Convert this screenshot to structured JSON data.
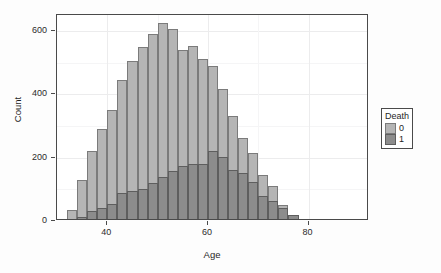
{
  "chart_data": {
    "type": "bar",
    "subtype": "histogram-overlapping",
    "title": "",
    "subtitle": "",
    "xlabel": "Age",
    "ylabel": "Count",
    "xlim": [
      30,
      92
    ],
    "ylim": [
      0,
      650
    ],
    "xticks": [
      40,
      60,
      80
    ],
    "xtick_labels": [
      "40",
      "60",
      "80"
    ],
    "yticks": [
      0,
      200,
      400,
      600
    ],
    "ytick_labels": [
      "0",
      "200",
      "400",
      "600"
    ],
    "grid": true,
    "bin_width": 2,
    "bin_starts": [
      32,
      34,
      36,
      38,
      40,
      42,
      44,
      46,
      48,
      50,
      52,
      54,
      56,
      58,
      60,
      62,
      64,
      66,
      68,
      70,
      72,
      74,
      76,
      78,
      80,
      82
    ],
    "legend": {
      "title": "Death",
      "position": "right",
      "entries": [
        {
          "label": "0",
          "color": "#b5b5b5"
        },
        {
          "label": "1",
          "color": "#8c8c8c"
        }
      ]
    },
    "series": [
      {
        "name": "0",
        "label": "Death = 0",
        "color": "#b5b5b5",
        "values": [
          35,
          130,
          220,
          290,
          350,
          445,
          505,
          550,
          590,
          625,
          605,
          540,
          552,
          510,
          490,
          415,
          330,
          262,
          215,
          145,
          112,
          52,
          20,
          6,
          2,
          0
        ]
      },
      {
        "name": "1",
        "label": "Death = 1",
        "color": "#8c8c8c",
        "values": [
          0,
          12,
          30,
          42,
          55,
          88,
          95,
          100,
          120,
          138,
          158,
          175,
          180,
          180,
          222,
          202,
          160,
          150,
          122,
          78,
          62,
          40,
          18,
          5,
          1,
          0
        ]
      }
    ],
    "colors": {
      "series_0": "#b5b5b5",
      "series_1": "#8c8c8c",
      "panel_background": "#ffffff",
      "panel_border": "#4a4a4a",
      "gridline": "#ececed",
      "axis_text": "#1f1f1f"
    }
  },
  "axes": {
    "x_title": "Age",
    "y_title": "Count"
  }
}
